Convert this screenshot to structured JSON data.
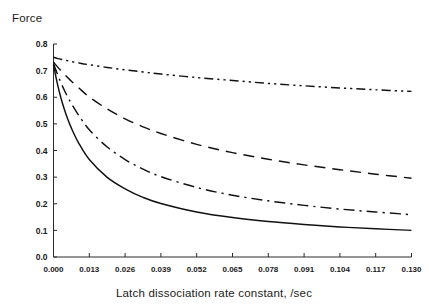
{
  "chart_data": {
    "type": "line",
    "title": "",
    "ylabel": "Force",
    "xlabel": "Latch dissociation rate constant, /sec",
    "xlim": [
      0.0,
      0.13
    ],
    "ylim": [
      0.0,
      0.8
    ],
    "grid": false,
    "legend": "none",
    "x_ticks": [
      "0.000",
      "0.013",
      "0.026",
      "0.039",
      "0.052",
      "0.065",
      "0.078",
      "0.091",
      "0.104",
      "0.117",
      "0.130"
    ],
    "x_tick_values": [
      0.0,
      0.013,
      0.026,
      0.039,
      0.052,
      0.065,
      0.078,
      0.091,
      0.104,
      0.117,
      0.13
    ],
    "y_ticks": [
      "0.0",
      "0.1",
      "0.2",
      "0.3",
      "0.4",
      "0.5",
      "0.6",
      "0.7",
      "0.8"
    ],
    "y_tick_values": [
      0.0,
      0.1,
      0.2,
      0.3,
      0.4,
      0.5,
      0.6,
      0.7,
      0.8
    ],
    "x": [
      0.0,
      0.0013,
      0.0026,
      0.0039,
      0.0052,
      0.0065,
      0.0091,
      0.013,
      0.0195,
      0.026,
      0.0325,
      0.039,
      0.052,
      0.065,
      0.078,
      0.091,
      0.104,
      0.117,
      0.13
    ],
    "series": [
      {
        "name": "curve-1",
        "style": "dash-dot-dot",
        "values": [
          0.75,
          0.746,
          0.743,
          0.74,
          0.737,
          0.734,
          0.729,
          0.722,
          0.712,
          0.703,
          0.695,
          0.687,
          0.674,
          0.663,
          0.652,
          0.643,
          0.635,
          0.628,
          0.622
        ]
      },
      {
        "name": "curve-2",
        "style": "long-dash",
        "values": [
          0.732,
          0.716,
          0.701,
          0.687,
          0.673,
          0.66,
          0.636,
          0.601,
          0.556,
          0.519,
          0.489,
          0.464,
          0.423,
          0.392,
          0.367,
          0.346,
          0.328,
          0.311,
          0.296
        ]
      },
      {
        "name": "curve-3",
        "style": "dash-dot",
        "values": [
          0.726,
          0.69,
          0.657,
          0.627,
          0.6,
          0.576,
          0.533,
          0.478,
          0.413,
          0.366,
          0.33,
          0.302,
          0.261,
          0.232,
          0.211,
          0.194,
          0.18,
          0.169,
          0.159
        ]
      },
      {
        "name": "curve-4",
        "style": "solid",
        "values": [
          0.722,
          0.656,
          0.601,
          0.556,
          0.517,
          0.484,
          0.429,
          0.366,
          0.299,
          0.256,
          0.224,
          0.201,
          0.169,
          0.148,
          0.133,
          0.122,
          0.113,
          0.106,
          0.1
        ]
      }
    ],
    "colors": {
      "line": "#111111",
      "axis": "#2b2b2b",
      "background": "#ffffff",
      "text": "#1a1a1a"
    }
  },
  "labels": {
    "y_axis_title": "Force",
    "x_axis_title": "Latch dissociation rate constant, /sec"
  }
}
